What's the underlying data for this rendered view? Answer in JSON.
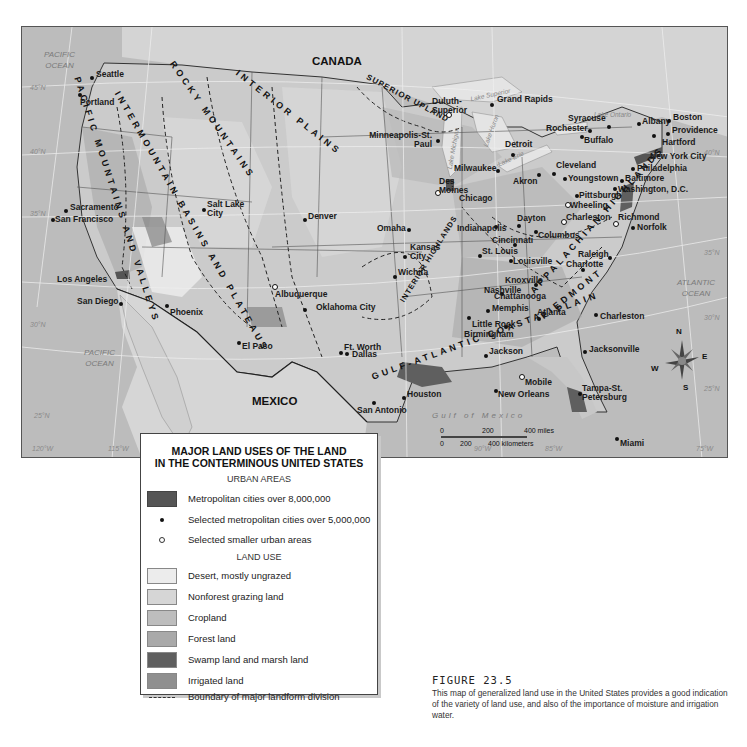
{
  "map": {
    "countries": {
      "canada": "CANADA",
      "mexico": "MEXICO"
    },
    "oceans": {
      "pacific_north": [
        "PACIFIC",
        "OCEAN"
      ],
      "pacific_south": [
        "PACIFIC",
        "OCEAN"
      ],
      "atlantic": [
        "ATLANTIC",
        "OCEAN"
      ],
      "gulf": "Gulf of Mexico"
    },
    "lakes": {
      "superior": "Lake Superior",
      "michigan": "Lake Michigan",
      "huron": "Lake Huron",
      "erie": "Lake Erie",
      "ontario": "Lake Ontario"
    },
    "latitudes": {
      "lat45": "45°N",
      "lat40": "40°N",
      "lat35": "35°N",
      "lat30": "30°N",
      "lat25": "25°N"
    },
    "longitudes": {
      "lon120": "120°W",
      "lon115": "115°W",
      "lon90": "90°W",
      "lon85": "85°W",
      "lon75": "75°W"
    },
    "regions": {
      "pacific_mountains": "PACIFIC MOUNTAINS AND VALLEYS",
      "intermountain": "INTERMOUNTAIN BASINS AND PLATEAUS",
      "rocky": "ROCKY MOUNTAINS",
      "interior_plains": "INTERIOR PLAINS",
      "superior_upland": "SUPERIOR UPLAND",
      "interior_highlands": "INTERIOR HIGHLANDS",
      "appalachian": "APPALACHIAN HIGHLANDS",
      "piedmont": "PIEDMONT",
      "coastal_plain": "GULF-ATLANTIC COASTAL PLAIN"
    },
    "cities": {
      "seattle": "Seattle",
      "portland": "Portland",
      "sacramento": "Sacramento",
      "san_francisco": "San Francisco",
      "los_angeles": "Los Angeles",
      "san_diego": "San Diego",
      "salt_lake": "Salt Lake City",
      "phoenix": "Phoenix",
      "denver": "Denver",
      "albuquerque": "Albuquerque",
      "el_paso": "El Paso",
      "omaha": "Omaha",
      "wichita": "Wichita",
      "oklahoma_city": "Oklahoma City",
      "ft_worth": "Ft. Worth",
      "dallas": "Dallas",
      "san_antonio": "San Antonio",
      "houston": "Houston",
      "kansas_city": "Kansas City",
      "minneapolis": "Minneapolis-St. Paul",
      "duluth": "Duluth-Superior",
      "des_moines": "Des Moines",
      "milwaukee": "Milwaukee",
      "chicago": "Chicago",
      "st_louis": "St. Louis",
      "little_rock": "Little Rock",
      "memphis": "Memphis",
      "nashville": "Nashville",
      "jackson": "Jackson",
      "new_orleans": "New Orleans",
      "mobile": "Mobile",
      "birmingham": "Birmingham",
      "chattanooga": "Chattanooga",
      "knoxville": "Knoxville",
      "atlanta": "Atlanta",
      "indianapolis": "Indianapolis",
      "louisville": "Louisville",
      "cincinnati": "Cincinnati",
      "dayton": "Dayton",
      "columbus": "Columbus",
      "grand_rapids": "Grand Rapids",
      "detroit": "Detroit",
      "akron": "Akron",
      "cleveland": "Cleveland",
      "youngstown": "Youngstown",
      "pittsburgh": "Pittsburgh",
      "wheeling": "Wheeling",
      "charleston_wv": "Charleston",
      "buffalo": "Buffalo",
      "rochester": "Rochester",
      "syracuse": "Syracuse",
      "albany": "Albany",
      "boston": "Boston",
      "providence": "Providence",
      "hartford": "Hartford",
      "new_york": "New York City",
      "philadelphia": "Philadelphia",
      "baltimore": "Baltimore",
      "washington": "Washington, D.C.",
      "richmond": "Richmond",
      "norfolk": "Norfolk",
      "raleigh": "Raleigh",
      "charlotte": "Charlotte",
      "charleston_sc": "Charleston",
      "jacksonville": "Jacksonville",
      "tampa": "Tampa-St. Petersburg",
      "miami": "Miami"
    },
    "scale": {
      "miles": [
        "0",
        "200",
        "400 miles"
      ],
      "km": [
        "0",
        "200",
        "400 kilometers"
      ]
    },
    "compass": {
      "n": "N",
      "s": "S",
      "e": "E",
      "w": "W"
    }
  },
  "legend": {
    "title_line1": "MAJOR LAND USES OF THE LAND",
    "title_line2": "IN THE CONTERMINOUS UNITED STATES",
    "urban_heading": "URBAN AREAS",
    "urban_items": [
      {
        "label": "Metropolitan cities over 8,000,000",
        "symbol": "dark-swatch"
      },
      {
        "label": "Selected metropolitan cities over 5,000,000",
        "symbol": "filled-dot"
      },
      {
        "label": "Selected smaller urban areas",
        "symbol": "open-dot"
      }
    ],
    "land_heading": "LAND USE",
    "land_items": [
      {
        "label": "Desert, mostly ungrazed",
        "color": "#ececec"
      },
      {
        "label": "Nonforest grazing land",
        "color": "#d6d6d6"
      },
      {
        "label": "Cropland",
        "color": "#bdbdbd"
      },
      {
        "label": "Forest land",
        "color": "#a9a9a9"
      },
      {
        "label": "Swamp land and marsh land",
        "color": "#5f5f5f"
      },
      {
        "label": "Irrigated land",
        "color": "#8f8f8f"
      }
    ],
    "boundary_label": "Boundary of major landform division",
    "metro_color": "#555555"
  },
  "caption": {
    "title": "FIGURE 23.5",
    "body": "This map of generalized land use in the United States provides a good indication of the variety of land use, and also of the importance of moisture and irrigation water."
  }
}
